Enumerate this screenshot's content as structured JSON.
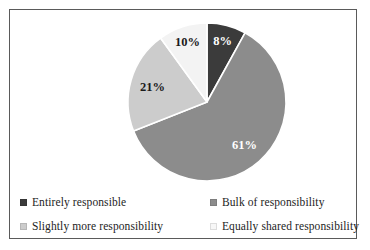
{
  "frame": {
    "border_color": "#5a5a5a",
    "background": "#ffffff"
  },
  "chart_data": {
    "type": "pie",
    "title": "",
    "subtitle": "",
    "xlabel": "",
    "ylabel": "",
    "grid": false,
    "legend_position": "bottom",
    "start_angle_deg": 0,
    "direction": "clockwise",
    "labels": [
      "Entirely responsible",
      "Bulk of responsibility",
      "Slightly more responsibility",
      "Equally shared responsibility"
    ],
    "values": [
      8,
      61,
      21,
      10
    ],
    "value_labels": [
      "8%",
      "61%",
      "21%",
      "10%"
    ],
    "colors": [
      "#3b3b3b",
      "#8c8c8c",
      "#cccccc",
      "#f3f3f3"
    ],
    "label_text_colors": [
      "#ffffff",
      "#ffffff",
      "#1a1a1a",
      "#1a1a1a"
    ],
    "separator_color": "#ffffff",
    "slices": [
      {
        "label": "Entirely responsible",
        "value": 8,
        "value_label": "8%",
        "color": "#3b3b3b",
        "label_color": "#ffffff"
      },
      {
        "label": "Bulk of responsibility",
        "value": 61,
        "value_label": "61%",
        "color": "#8c8c8c",
        "label_color": "#ffffff"
      },
      {
        "label": "Slightly more responsibility",
        "value": 21,
        "value_label": "21%",
        "color": "#cccccc",
        "label_color": "#1a1a1a"
      },
      {
        "label": "Equally shared responsibility",
        "value": 10,
        "value_label": "10%",
        "color": "#f3f3f3",
        "label_color": "#1a1a1a"
      }
    ]
  },
  "legend": {
    "items": [
      {
        "label": "Entirely responsible",
        "color": "#3b3b3b",
        "marker": "square-marker"
      },
      {
        "label": "Bulk of responsibility",
        "color": "#8c8c8c",
        "marker": "square-marker"
      },
      {
        "label": "Slightly more responsibility",
        "color": "#cccccc",
        "marker": "square-marker"
      },
      {
        "label": "Equally shared responsibility",
        "color": "#f7f7f7",
        "marker": "square-marker"
      }
    ]
  }
}
